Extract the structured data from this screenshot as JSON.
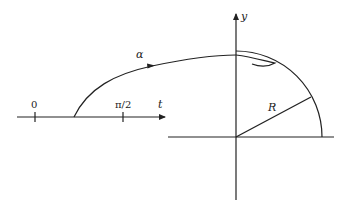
{
  "diagram": {
    "colors": {
      "stroke": "#222222",
      "background": "#ffffff"
    },
    "t_axis": {
      "label": "t",
      "ticks": [
        {
          "label": "0"
        },
        {
          "label": "π/2"
        }
      ]
    },
    "curve": {
      "label": "α"
    },
    "plane": {
      "y_axis_label": "y",
      "radius_label": "R"
    }
  }
}
